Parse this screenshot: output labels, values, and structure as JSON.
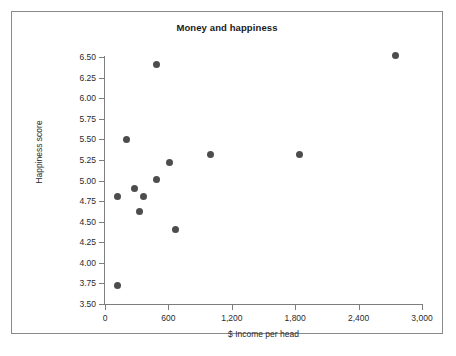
{
  "chart_data": {
    "type": "scatter",
    "title": "Money and happiness",
    "xlabel": "$ Income per head",
    "ylabel": "Happiness score",
    "xlim": [
      0,
      3000
    ],
    "ylim": [
      3.5,
      6.5
    ],
    "grid": false,
    "legend": null,
    "x_ticks": [
      0,
      600,
      1200,
      1800,
      2400,
      3000
    ],
    "x_tick_labels": [
      "0",
      "600",
      "1,200",
      "1,800",
      "2,400",
      "3,000"
    ],
    "y_ticks": [
      3.5,
      3.75,
      4.0,
      4.25,
      4.5,
      4.75,
      5.0,
      5.25,
      5.5,
      5.75,
      6.0,
      6.25,
      6.5
    ],
    "y_tick_labels": [
      "3.50",
      "3.75",
      "4.00",
      "4.25",
      "4.50",
      "4.75",
      "5.00",
      "5.25",
      "5.50",
      "5.75",
      "6.00",
      "6.25",
      "6.50"
    ],
    "marker_color": "#4d4d4d",
    "marker_shape": "circle",
    "points": [
      {
        "x": 120,
        "y": 3.72
      },
      {
        "x": 115,
        "y": 4.8
      },
      {
        "x": 200,
        "y": 5.5
      },
      {
        "x": 275,
        "y": 4.9
      },
      {
        "x": 330,
        "y": 4.62
      },
      {
        "x": 360,
        "y": 4.8
      },
      {
        "x": 490,
        "y": 5.01
      },
      {
        "x": 490,
        "y": 6.41
      },
      {
        "x": 615,
        "y": 5.22
      },
      {
        "x": 670,
        "y": 4.41
      },
      {
        "x": 1000,
        "y": 5.31
      },
      {
        "x": 1840,
        "y": 5.32
      },
      {
        "x": 2750,
        "y": 6.52
      }
    ]
  }
}
